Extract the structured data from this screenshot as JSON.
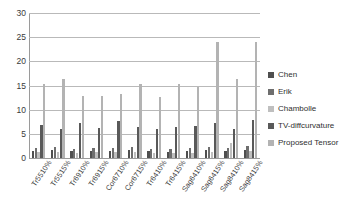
{
  "chart_data": {
    "type": "bar",
    "title": "",
    "subtitle": "",
    "xlabel": "",
    "ylabel": "",
    "ylim": [
      0,
      30
    ],
    "y_ticks": [
      0,
      5,
      10,
      15,
      20,
      25,
      30
    ],
    "grid": true,
    "legend_position": "right",
    "categories": [
      "Tr5510%",
      "Tr5515%",
      "Tr6910%",
      "Tr6915%",
      "Cor6710%",
      "Cor6715%",
      "Tr6410%",
      "Tr6415%",
      "Sag6410%",
      "Sag6415%",
      "Sag8410%",
      "Sag8415%"
    ],
    "series": [
      {
        "name": "Chen",
        "color": "#4f4f4f",
        "values": [
          1.5,
          1.6,
          1.4,
          1.5,
          1.5,
          1.6,
          1.4,
          1.3,
          1.4,
          1.6,
          1.5,
          1.7
        ]
      },
      {
        "name": "Erik",
        "color": "#6e6e6e",
        "values": [
          2.1,
          2.2,
          1.9,
          2.0,
          2.1,
          2.2,
          1.9,
          1.8,
          2.0,
          2.2,
          2.0,
          2.4
        ]
      },
      {
        "name": "Chambolle",
        "color": "#bfbfbf",
        "values": [
          1.2,
          1.3,
          1.1,
          1.2,
          1.2,
          1.3,
          1.1,
          1.0,
          1.1,
          1.3,
          3.2,
          1.4
        ]
      },
      {
        "name": "TV-diffcurvature",
        "color": "#595959",
        "values": [
          6.9,
          6.1,
          7.2,
          6.2,
          7.7,
          6.5,
          6.0,
          6.4,
          6.6,
          7.3,
          6.1,
          7.8
        ]
      },
      {
        "name": "Proposed Tensor",
        "color": "#b3b3b3",
        "values": [
          15.3,
          16.4,
          12.9,
          12.9,
          13.2,
          15.4,
          12.7,
          15.4,
          14.6,
          23.9,
          16.4,
          24.1
        ]
      }
    ]
  },
  "legend": {
    "items": [
      {
        "label": "Chen"
      },
      {
        "label": "Erik"
      },
      {
        "label": "Chambolle"
      },
      {
        "label": "TV-diffcurvature"
      },
      {
        "label": "Proposed Tensor"
      }
    ]
  },
  "axis": {
    "y_tick_labels": [
      "30",
      "25",
      "20",
      "15",
      "10",
      "5",
      "0"
    ]
  },
  "colors": {
    "gridline": "#b9b9b9",
    "axis": "#9a9a9a",
    "text": "#3a3a3a",
    "background": "#ffffff"
  }
}
